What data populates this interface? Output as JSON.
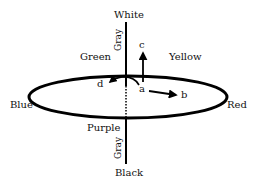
{
  "diagram": {
    "type": "color-solid",
    "axis_labels": {
      "top": "White",
      "bottom": "Black",
      "axis_upper": "Gray",
      "axis_lower": "Gray"
    },
    "hue_labels": {
      "upper_left": "Green",
      "upper_right": "Yellow",
      "left": "Blue",
      "right": "Red",
      "lower_left": "Purple"
    },
    "vectors": {
      "origin": "a",
      "up": "c",
      "right": "b",
      "curved_left": "d"
    },
    "colors": {
      "stroke": "#000000",
      "text": "#111111",
      "background": "#ffffff"
    }
  }
}
